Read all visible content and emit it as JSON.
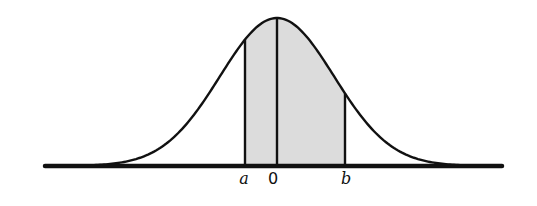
{
  "diagram": {
    "type": "normal-distribution-curve",
    "colors": {
      "line": "#111111",
      "shade": "#dcdcdc",
      "background": "#ffffff"
    },
    "geometry": {
      "axis_x0": 45,
      "axis_x1": 502,
      "axis_y": 166,
      "center_x": 277,
      "peak_y": 18,
      "sigma_px": 57
    },
    "markers": [
      {
        "id": "a",
        "label": "a",
        "x": 245
      },
      {
        "id": "zero",
        "label": "0",
        "x": 277
      },
      {
        "id": "b",
        "label": "b",
        "x": 345
      }
    ],
    "shaded_region": {
      "from": "a",
      "to": "b"
    }
  }
}
